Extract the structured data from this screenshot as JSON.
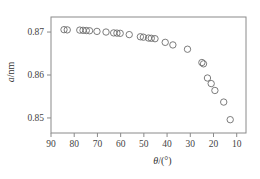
{
  "chart_data": {
    "type": "scatter",
    "title": "",
    "subtitle": "",
    "xlabel": "θ/(°)",
    "ylabel": "a/nm",
    "xlabel_parts": {
      "symbol": "θ",
      "unit": "/(°)"
    },
    "ylabel_parts": {
      "symbol": "a",
      "unit": "/nm"
    },
    "xlim": [
      90,
      6
    ],
    "ylim": [
      0.8465,
      0.8735
    ],
    "x_ticks": [
      90,
      80,
      70,
      60,
      50,
      40,
      30,
      20,
      10
    ],
    "x_tick_labels": [
      "90",
      "80",
      "70",
      "60",
      "50",
      "40",
      "30",
      "20",
      "10"
    ],
    "y_ticks": [
      0.85,
      0.86,
      0.87
    ],
    "y_tick_labels": [
      "0.85",
      "0.86",
      "0.87"
    ],
    "x_axis_direction": "descending",
    "grid": false,
    "legend": null,
    "marker": "open-circle",
    "marker_color": "#6d6d6d",
    "marker_size": 3.2,
    "series": [
      {
        "name": "lattice parameter vs theta",
        "points": [
          [
            84.4,
            0.87055
          ],
          [
            83.0,
            0.8705
          ],
          [
            77.6,
            0.87045
          ],
          [
            76.2,
            0.8704
          ],
          [
            74.8,
            0.87035
          ],
          [
            73.4,
            0.8703
          ],
          [
            70.2,
            0.87015
          ],
          [
            66.3,
            0.87
          ],
          [
            63.0,
            0.8698
          ],
          [
            61.6,
            0.86975
          ],
          [
            60.2,
            0.8697
          ],
          [
            56.3,
            0.8694
          ],
          [
            51.5,
            0.8689
          ],
          [
            50.2,
            0.8688
          ],
          [
            48.0,
            0.8686
          ],
          [
            46.8,
            0.86855
          ],
          [
            45.2,
            0.86845
          ],
          [
            40.8,
            0.8676
          ],
          [
            37.5,
            0.867
          ],
          [
            31.2,
            0.866
          ],
          [
            25.0,
            0.8629
          ],
          [
            24.3,
            0.8626
          ],
          [
            22.6,
            0.8593
          ],
          [
            21.0,
            0.858
          ],
          [
            19.4,
            0.8564
          ],
          [
            15.6,
            0.8537
          ],
          [
            12.8,
            0.8496
          ]
        ]
      }
    ]
  },
  "plot_box": {
    "left": 51,
    "right": 246,
    "top": 17,
    "bottom": 133
  }
}
